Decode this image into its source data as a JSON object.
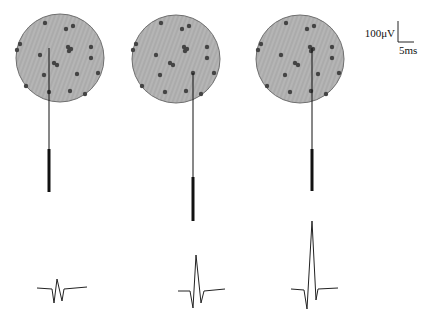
{
  "scale_bar": {
    "voltage_label": "100μV",
    "time_label": "5ms"
  },
  "colors": {
    "tissue_fill": "#b3b3b3",
    "tissue_stroke": "#6e6e6e",
    "neuron": "#444444",
    "electrode": "#111111",
    "trace": "#222222"
  },
  "panels": [
    {
      "id": "panel-1",
      "circle": {
        "cx": 60,
        "cy": 58,
        "r": 44
      },
      "neurons": [
        [
          45,
          23
        ],
        [
          66,
          29
        ],
        [
          73,
          26
        ],
        [
          20,
          44
        ],
        [
          17,
          50
        ],
        [
          68,
          47
        ],
        [
          71,
          49
        ],
        [
          69,
          51
        ],
        [
          91,
          47
        ],
        [
          91,
          58
        ],
        [
          40,
          55
        ],
        [
          54,
          63
        ],
        [
          57,
          65
        ],
        [
          98,
          73
        ],
        [
          77,
          74
        ],
        [
          44,
          75
        ],
        [
          26,
          86
        ],
        [
          49,
          92
        ],
        [
          70,
          91
        ],
        [
          85,
          94
        ]
      ],
      "electrode": {
        "x": 49,
        "tip_y": 48,
        "shaft_start": 149,
        "shaft_end": 192
      },
      "waveform": [
        [
          37,
          288
        ],
        [
          52,
          289
        ],
        [
          54,
          303
        ],
        [
          57,
          279
        ],
        [
          62,
          301
        ],
        [
          64,
          289
        ],
        [
          87,
          287
        ]
      ]
    },
    {
      "id": "panel-2",
      "circle": {
        "cx": 176,
        "cy": 59,
        "r": 44
      },
      "neurons": [
        [
          161,
          23
        ],
        [
          182,
          29
        ],
        [
          189,
          26
        ],
        [
          136,
          44
        ],
        [
          133,
          50
        ],
        [
          184,
          47
        ],
        [
          187,
          49
        ],
        [
          185,
          51
        ],
        [
          207,
          47
        ],
        [
          207,
          58
        ],
        [
          156,
          55
        ],
        [
          170,
          63
        ],
        [
          173,
          65
        ],
        [
          214,
          73
        ],
        [
          193,
          73
        ],
        [
          160,
          75
        ],
        [
          142,
          86
        ],
        [
          165,
          92
        ],
        [
          186,
          91
        ],
        [
          201,
          94
        ]
      ],
      "electrode": {
        "x": 193,
        "tip_y": 73,
        "shaft_start": 177,
        "shaft_end": 221
      },
      "waveform": [
        [
          178,
          291
        ],
        [
          190,
          291
        ],
        [
          193,
          308
        ],
        [
          196,
          255
        ],
        [
          201,
          303
        ],
        [
          204,
          291
        ],
        [
          225,
          289
        ]
      ]
    },
    {
      "id": "panel-3",
      "circle": {
        "cx": 300,
        "cy": 59,
        "r": 44
      },
      "neurons": [
        [
          286,
          23
        ],
        [
          307,
          29
        ],
        [
          314,
          26
        ],
        [
          261,
          44
        ],
        [
          258,
          50
        ],
        [
          310,
          47
        ],
        [
          313,
          49
        ],
        [
          311,
          51
        ],
        [
          332,
          47
        ],
        [
          332,
          58
        ],
        [
          281,
          55
        ],
        [
          295,
          63
        ],
        [
          298,
          65
        ],
        [
          339,
          73
        ],
        [
          318,
          74
        ],
        [
          285,
          75
        ],
        [
          267,
          86
        ],
        [
          290,
          92
        ],
        [
          311,
          91
        ],
        [
          326,
          94
        ]
      ],
      "electrode": {
        "x": 312,
        "tip_y": 48,
        "shaft_start": 149,
        "shaft_end": 191
      },
      "waveform": [
        [
          291,
          289
        ],
        [
          304,
          290
        ],
        [
          307,
          309
        ],
        [
          312,
          221
        ],
        [
          316,
          300
        ],
        [
          318,
          289
        ],
        [
          338,
          288
        ]
      ]
    }
  ]
}
